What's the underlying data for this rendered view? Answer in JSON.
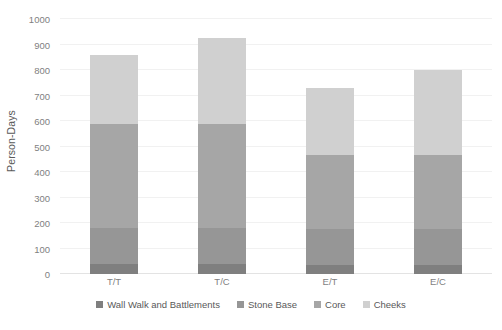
{
  "chart_data": {
    "type": "bar",
    "subtype": "stacked-bar",
    "title": "",
    "xlabel": "",
    "ylabel": "Person-Days",
    "ylim": [
      0,
      1000
    ],
    "yticks": [
      0,
      100,
      200,
      300,
      400,
      500,
      600,
      700,
      800,
      900,
      1000
    ],
    "grid": true,
    "legend_position": "bottom",
    "categories": [
      "T/T",
      "T/C",
      "E/T",
      "E/C"
    ],
    "series": [
      {
        "name": "Wall Walk and Battlements",
        "color": "#7f7f7f",
        "values": [
          40,
          40,
          35,
          35
        ]
      },
      {
        "name": "Stone Base",
        "color": "#969696",
        "values": [
          140,
          140,
          140,
          140
        ]
      },
      {
        "name": "Core",
        "color": "#a6a6a6",
        "values": [
          410,
          410,
          290,
          290
        ]
      },
      {
        "name": "Cheeks",
        "color": "#d0d0d0",
        "values": [
          270,
          335,
          265,
          335
        ]
      }
    ],
    "totals": [
      860,
      925,
      730,
      800
    ]
  },
  "axis": {
    "y_title": "Person-Days"
  }
}
